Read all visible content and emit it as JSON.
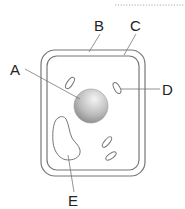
{
  "diagram": {
    "type": "plant cell",
    "labels": {
      "A": "A",
      "B": "B",
      "C": "C",
      "D": "D",
      "E": "E"
    },
    "parts": {
      "A": "nucleus",
      "B": "cell wall",
      "C": "cell membrane",
      "D": "chloroplast",
      "E": "vacuole"
    }
  },
  "colors": {
    "outline": "#777777",
    "nucleus_light": "#f2f2f2",
    "nucleus_dark": "#8a8a8a",
    "text": "#222222",
    "dotted_line": "#aaaaaa"
  }
}
